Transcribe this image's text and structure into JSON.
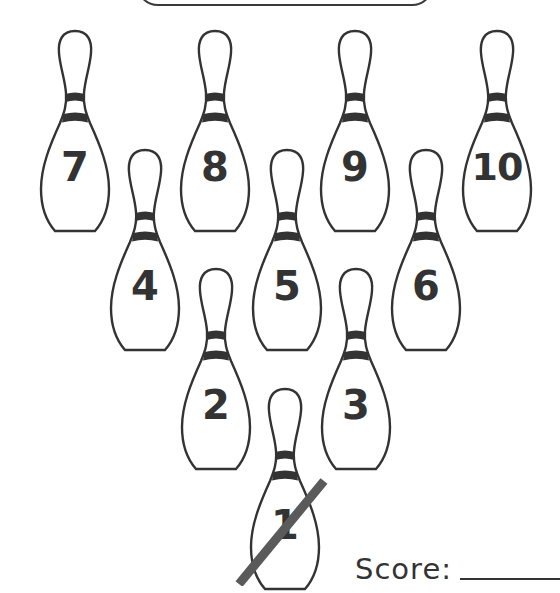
{
  "worksheet": {
    "title_box": "",
    "score_label": "Score:",
    "score_value": ""
  },
  "pins": [
    {
      "number": "7",
      "knocked_down": false
    },
    {
      "number": "8",
      "knocked_down": false
    },
    {
      "number": "9",
      "knocked_down": false
    },
    {
      "number": "10",
      "knocked_down": false
    },
    {
      "number": "4",
      "knocked_down": false
    },
    {
      "number": "5",
      "knocked_down": false
    },
    {
      "number": "6",
      "knocked_down": false
    },
    {
      "number": "2",
      "knocked_down": false
    },
    {
      "number": "3",
      "knocked_down": false
    },
    {
      "number": "1",
      "knocked_down": true
    }
  ],
  "colors": {
    "outline": "#333333",
    "slash": "#5a5a5a",
    "background": "#ffffff"
  }
}
